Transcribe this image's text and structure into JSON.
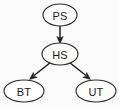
{
  "diagram": {
    "background_color": "#fbfbfb",
    "node_fill": "#ffffff",
    "node_stroke": "#2b2b2b",
    "edge_color": "#1f1f1f",
    "label_color": "#1a1a1a",
    "nodes": [
      {
        "id": "PS",
        "label": "PS",
        "cx": 60,
        "cy": 15,
        "rx": 17,
        "ry": 11
      },
      {
        "id": "HS",
        "label": "HS",
        "cx": 60,
        "cy": 54,
        "rx": 18,
        "ry": 11
      },
      {
        "id": "BT",
        "label": "BT",
        "cx": 24,
        "cy": 91,
        "rx": 20,
        "ry": 11
      },
      {
        "id": "UT",
        "label": "UT",
        "cx": 96,
        "cy": 91,
        "rx": 20,
        "ry": 11
      }
    ],
    "edges": [
      {
        "from": "PS",
        "to": "HS",
        "direction": "down"
      },
      {
        "from": "HS",
        "to": "BT",
        "direction": "down-left"
      },
      {
        "from": "HS",
        "to": "UT",
        "direction": "down-right"
      }
    ]
  }
}
